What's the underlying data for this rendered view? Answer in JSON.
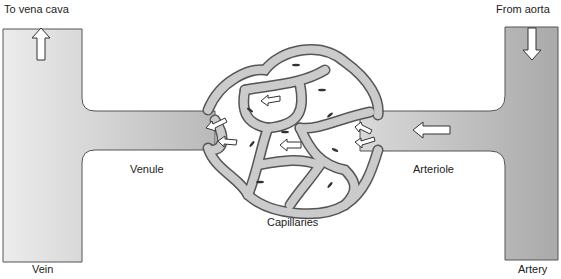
{
  "diagram": {
    "type": "circulation-schematic",
    "labels": {
      "to_vena_cava": "To vena cava",
      "from_aorta": "From aorta",
      "vein": "Vein",
      "artery": "Artery",
      "venule": "Venule",
      "arteriole": "Arteriole",
      "capillaries": "Capillaries"
    },
    "flow_direction": "right-to-left",
    "colors": {
      "vessel_fill": "#c8c8c8",
      "vessel_light": "#e6e6e6",
      "outline": "#555555",
      "arrow_fill": "#ffffff",
      "background": "#ffffff"
    }
  }
}
